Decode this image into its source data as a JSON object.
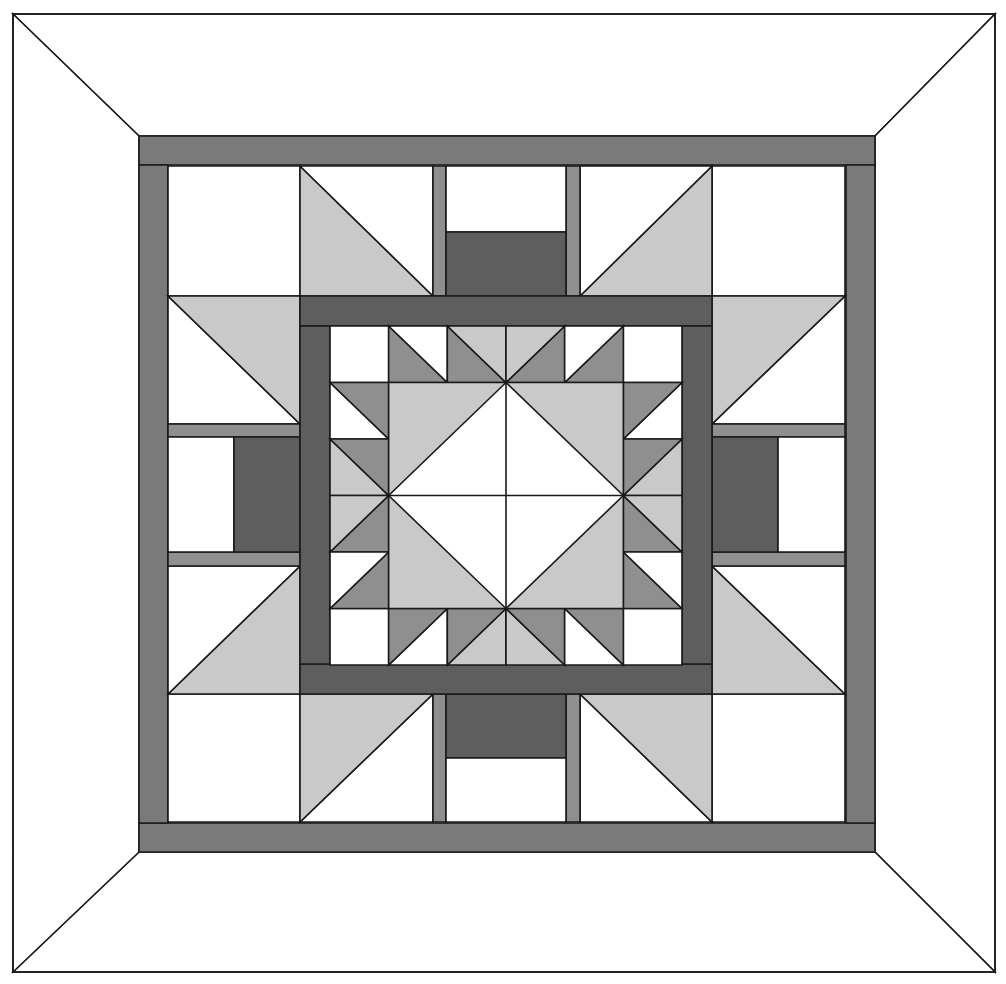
{
  "colors": {
    "white": "#ffffff",
    "light": "#c9c9c9",
    "medium": "#8f8f8f",
    "frame": "#7a7a7a",
    "dark": "#5e5e5e",
    "line": "#1a1a1a"
  },
  "outer_border": {
    "x0": 13,
    "y0": 14,
    "x1": 995,
    "y1": 972
  },
  "inner_frame": {
    "x0": 139,
    "y0": 136,
    "x1": 875,
    "y1": 852,
    "width": 29
  },
  "grid": {
    "xs": [
      168,
      300,
      433,
      446,
      566,
      580,
      712,
      845
    ],
    "ys": [
      166,
      296,
      424,
      437,
      552,
      566,
      694,
      822
    ]
  },
  "center_frame": {
    "x0": 300,
    "y0": 296,
    "x1": 712,
    "y1": 694,
    "width": 30
  },
  "center_medallion": {
    "x0": 330,
    "y0": 326,
    "x1": 682,
    "y1": 665
  }
}
